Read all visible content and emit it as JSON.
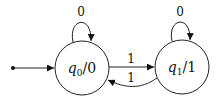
{
  "diagram": {
    "type": "moore-machine",
    "states": [
      {
        "id": "q0",
        "name": "q",
        "subscript": "0",
        "output": "/0",
        "initial": true
      },
      {
        "id": "q1",
        "name": "q",
        "subscript": "1",
        "output": "/1",
        "initial": false
      }
    ],
    "transitions": [
      {
        "from": "q0",
        "to": "q0",
        "label": "0"
      },
      {
        "from": "q0",
        "to": "q1",
        "label": "1"
      },
      {
        "from": "q1",
        "to": "q0",
        "label": "1"
      },
      {
        "from": "q1",
        "to": "q1",
        "label": "0"
      }
    ]
  }
}
